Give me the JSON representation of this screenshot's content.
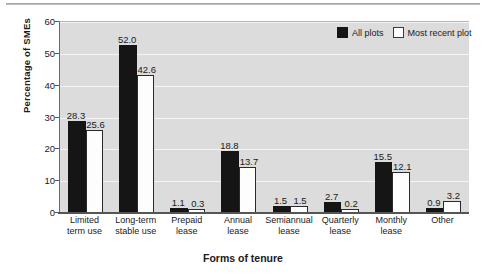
{
  "chart_data": {
    "type": "bar",
    "title": "",
    "xlabel": "Forms of tenure",
    "ylabel": "Percentage of SMEs",
    "ylim": [
      0,
      60
    ],
    "yticks": [
      0,
      10,
      20,
      30,
      40,
      50,
      60
    ],
    "grid": true,
    "legend_position": "top-right",
    "categories": [
      "Limited term use",
      "Long-term stable use",
      "Prepaid lease",
      "Annual lease",
      "Semiannual lease",
      "Quarterly lease",
      "Monthly lease",
      "Other"
    ],
    "category_lines": [
      [
        "Limited",
        "term use"
      ],
      [
        "Long-term",
        "stable use"
      ],
      [
        "Prepaid",
        "lease"
      ],
      [
        "Annual",
        "lease"
      ],
      [
        "Semiannual",
        "lease"
      ],
      [
        "Quarterly",
        "lease"
      ],
      [
        "Monthly",
        "lease"
      ],
      [
        "Other",
        ""
      ]
    ],
    "series": [
      {
        "name": "All plots",
        "color": "#151515",
        "values": [
          28.3,
          52.0,
          1.1,
          18.8,
          1.5,
          2.7,
          15.5,
          0.9
        ],
        "labels": [
          "28.3",
          "52.0",
          "1.1",
          "18.8",
          "1.5",
          "2.7",
          "15.5",
          "0.9"
        ]
      },
      {
        "name": "Most recent plot",
        "color": "#ffffff",
        "values": [
          25.6,
          42.6,
          0.3,
          13.7,
          1.5,
          0.2,
          12.1,
          3.2
        ],
        "labels": [
          "25.6",
          "42.6",
          "0.3",
          "13.7",
          "1.5",
          "0.2",
          "12.1",
          "3.2"
        ]
      }
    ]
  },
  "legend": {
    "items": [
      {
        "label": "All plots",
        "swatch": "dark"
      },
      {
        "label": "Most recent plot",
        "swatch": "light"
      }
    ]
  },
  "ytick_labels": [
    "0",
    "10",
    "20",
    "30",
    "40",
    "50",
    "60"
  ]
}
